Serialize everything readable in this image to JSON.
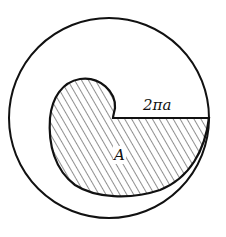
{
  "figure": {
    "labels": {
      "radius": "2πa",
      "area": "A"
    },
    "colors": {
      "stroke": "#111111",
      "background": "#ffffff"
    }
  }
}
